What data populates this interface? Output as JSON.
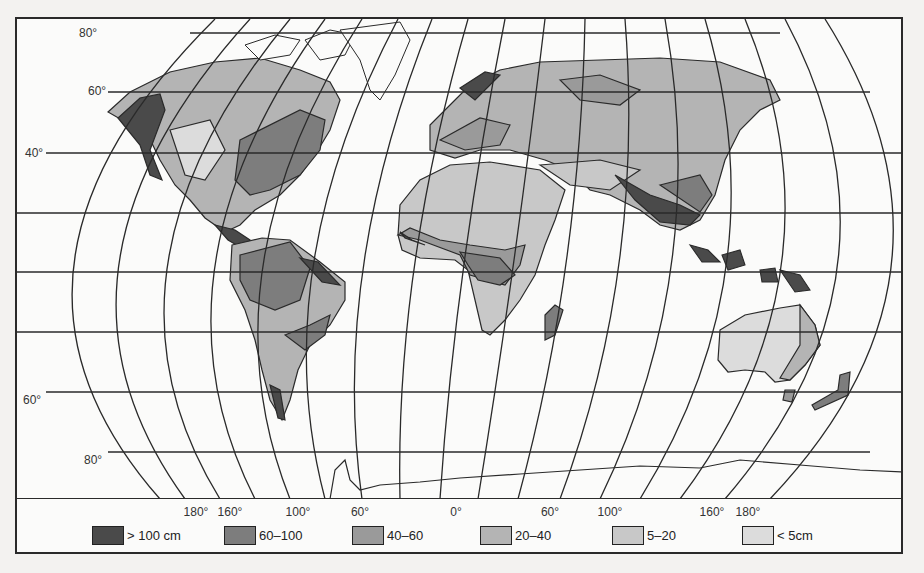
{
  "map": {
    "subject": "World annual precipitation map",
    "latitude_labels": [
      {
        "text": "80°",
        "x": 79,
        "y": 26
      },
      {
        "text": "60°",
        "x": 88,
        "y": 84
      },
      {
        "text": "40°",
        "x": 25,
        "y": 146
      },
      {
        "text": "60°",
        "x": 23,
        "y": 393
      },
      {
        "text": "80°",
        "x": 84,
        "y": 453
      }
    ],
    "longitude_labels": [
      {
        "text": "180°",
        "x": 196
      },
      {
        "text": "160°",
        "x": 230
      },
      {
        "text": "100°",
        "x": 298
      },
      {
        "text": "60°",
        "x": 360
      },
      {
        "text": "0°",
        "x": 456
      },
      {
        "text": "60°",
        "x": 550
      },
      {
        "text": "100°",
        "x": 610
      },
      {
        "text": "160°",
        "x": 712
      },
      {
        "text": "180°",
        "x": 748
      }
    ]
  },
  "legend": {
    "items": [
      {
        "label": "> 100 cm",
        "color": "#4a4a4a",
        "x": 92
      },
      {
        "label": "60–100",
        "color": "#7d7d7d",
        "x": 224
      },
      {
        "label": "40–60",
        "color": "#9a9a9a",
        "x": 352
      },
      {
        "label": "20–40",
        "color": "#b4b4b4",
        "x": 480
      },
      {
        "label": "5–20",
        "color": "#c8c8c8",
        "x": 612
      },
      {
        "label": "< 5cm",
        "color": "#dcdcdc",
        "x": 742
      }
    ]
  },
  "background_page_text": [
    "process ... ocean and continents",
    "... pattern ... and",
    "... of ... the",
    "... ward ... the",
    "Atlantic ... toward ... the basin",
    "... more ... and",
    "... ocean ... we",
    "",
    "... these ... very",
    "... quite ... the ... 1995 ... so",
    "... the ... these",
    "... north",
    "... Southern Hemisphere",
    "... nearly ... with"
  ]
}
